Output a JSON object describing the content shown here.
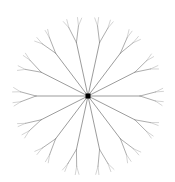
{
  "figure": {
    "canvas": {
      "width": 175,
      "height": 182,
      "background_color": "#ffffff"
    },
    "root_node": {
      "label": "root",
      "shape": "square",
      "color": "#000000",
      "center_x": 88,
      "center_y": 96,
      "size_px": 5
    },
    "style": {
      "edge_color": "#8a8a8a",
      "edge_color_outer": "#b0b0b0",
      "edge_width_level_1": 0.85,
      "edge_width_level_2": 0.7,
      "edge_width_level_3": 0.55
    }
  },
  "chart_data": {
    "type": "diagram",
    "diagram_kind": "radial-tree",
    "xlabel": "",
    "ylabel": "",
    "grid": false,
    "legend": false,
    "center": [
      88,
      96
    ],
    "spoke_count": 14,
    "angle_step_deg": 25.714,
    "start_angle_deg": 0,
    "branch_depth": 3,
    "branch_split": 2,
    "level_lengths_px": [
      52,
      16,
      8
    ],
    "level_spread_deg": [
      0,
      17,
      13
    ],
    "radius_x_px": 74,
    "radius_y_px": 78,
    "spoke_angles_deg": [
      0,
      25.714,
      51.429,
      77.143,
      102.857,
      128.571,
      154.286,
      180,
      205.714,
      231.429,
      257.143,
      282.857,
      308.571,
      334.286
    ]
  }
}
